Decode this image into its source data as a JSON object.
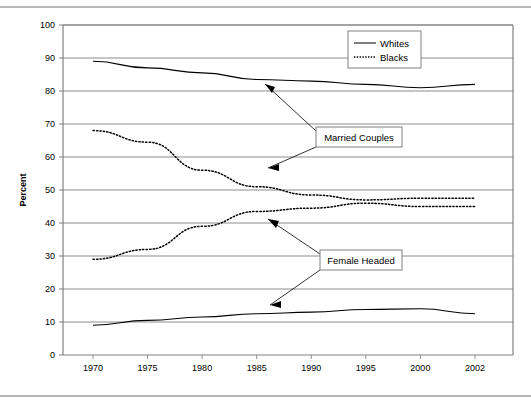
{
  "chart_data": {
    "type": "line",
    "title": "",
    "xlabel": "",
    "ylabel": "Percent",
    "ylim": [
      0,
      100
    ],
    "xlim": [
      1970,
      2002
    ],
    "grid": true,
    "grid_orientation": "horizontal",
    "legend_position": "top-right",
    "x_tick_labels": [
      "1970",
      "1975",
      "1980",
      "1985",
      "1990",
      "1995",
      "2000",
      "2002"
    ],
    "x_tick_values": [
      1970,
      1975,
      1980,
      1985,
      1990,
      1995,
      2000,
      2002
    ],
    "y_tick_labels": [
      "0",
      "10",
      "20",
      "30",
      "40",
      "50",
      "60",
      "70",
      "80",
      "90",
      "100"
    ],
    "y_tick_values": [
      0,
      10,
      20,
      30,
      40,
      50,
      60,
      70,
      80,
      90,
      100
    ],
    "legend": [
      {
        "name": "Whites",
        "style": "solid"
      },
      {
        "name": "Blacks",
        "style": "dotted"
      }
    ],
    "annotations": [
      {
        "label": "Married Couples",
        "points_to": [
          "whites-married-couples",
          "blacks-married-couples"
        ]
      },
      {
        "label": "Female Headed",
        "points_to": [
          "blacks-female-headed",
          "whites-female-headed"
        ]
      }
    ],
    "series": [
      {
        "name": "Whites Married Couples",
        "group": "Whites",
        "category": "Married Couples",
        "style": "solid",
        "x": [
          1970,
          1975,
          1980,
          1985,
          1990,
          1995,
          2000,
          2002
        ],
        "values": [
          89,
          87,
          85.5,
          83.5,
          83,
          82,
          81,
          82
        ]
      },
      {
        "name": "Blacks Married Couples",
        "group": "Blacks",
        "category": "Married Couples",
        "style": "dotted",
        "x": [
          1970,
          1975,
          1980,
          1985,
          1990,
          1995,
          2000,
          2002
        ],
        "values": [
          68,
          64.5,
          56,
          51,
          48.5,
          47,
          47.5,
          47.5
        ]
      },
      {
        "name": "Blacks Female Headed",
        "group": "Blacks",
        "category": "Female Headed",
        "style": "dotted",
        "x": [
          1970,
          1975,
          1980,
          1985,
          1990,
          1995,
          2000,
          2002
        ],
        "values": [
          29,
          32,
          39,
          43.5,
          44.5,
          46,
          45,
          45
        ]
      },
      {
        "name": "Whites Female Headed",
        "group": "Whites",
        "category": "Female Headed",
        "style": "solid",
        "x": [
          1970,
          1975,
          1980,
          1985,
          1990,
          1995,
          2000,
          2002
        ],
        "values": [
          9,
          10.5,
          11.5,
          12.5,
          13,
          13.8,
          14,
          12.5
        ]
      }
    ]
  },
  "axis": {
    "y_title": "Percent"
  },
  "legend": {
    "whites_label": "Whites",
    "blacks_label": "Blacks"
  },
  "annotations": {
    "married_couples_label": "Married Couples",
    "female_headed_label": "Female Headed"
  },
  "colors": {
    "line": "#000000",
    "grid": "#808080",
    "axis": "#808080",
    "background": "#ffffff",
    "rule": "#b8b8b8"
  }
}
